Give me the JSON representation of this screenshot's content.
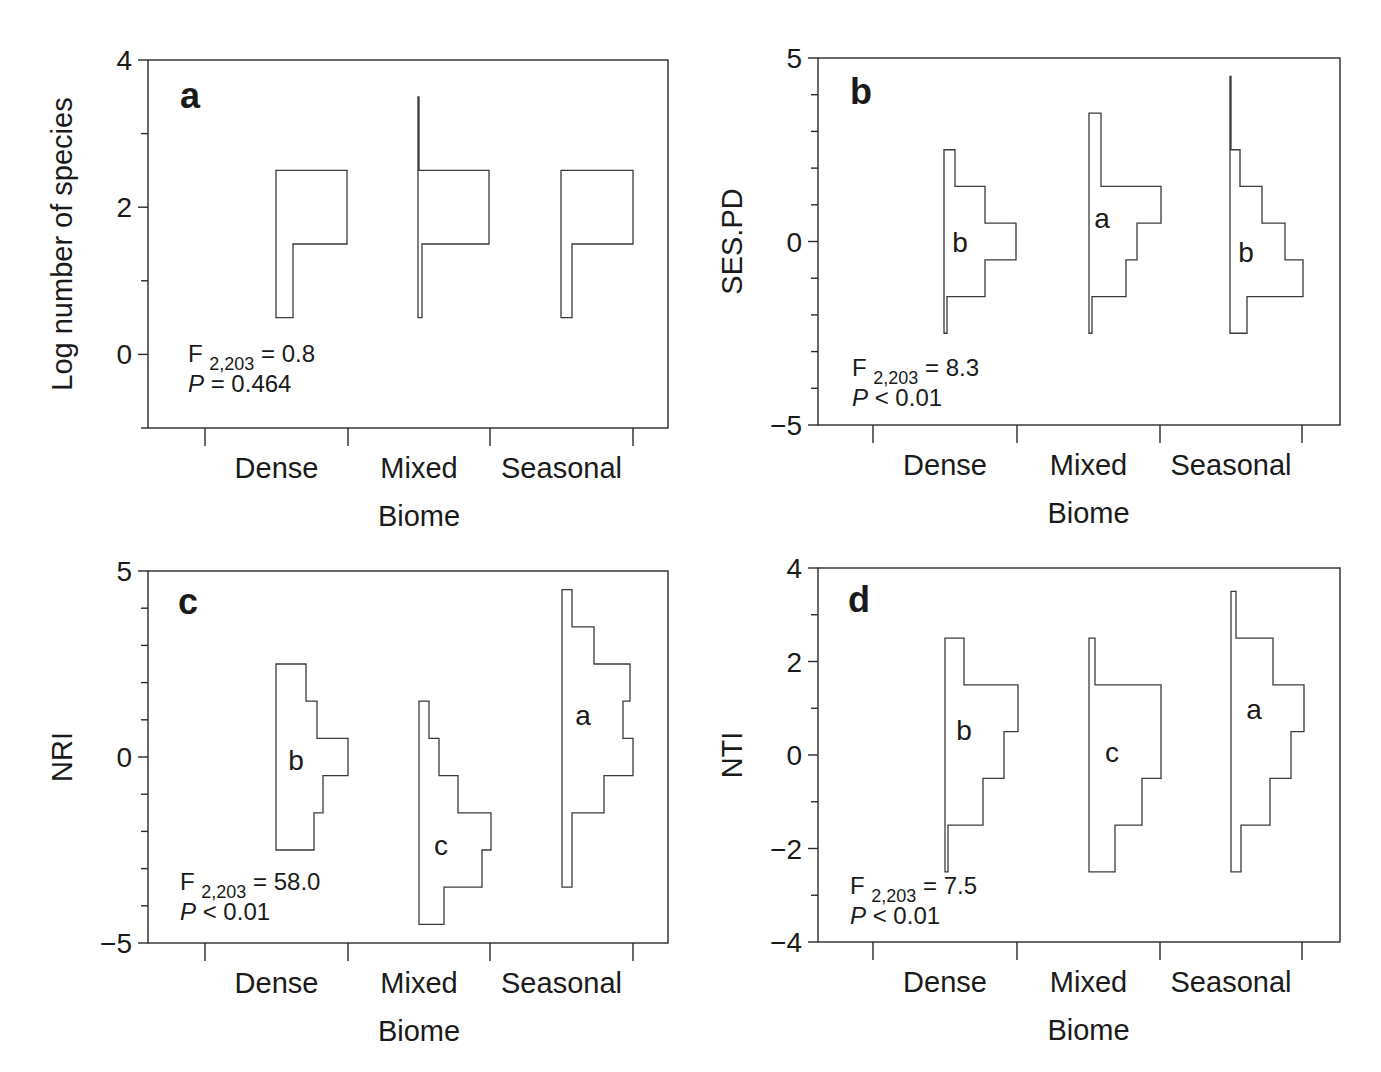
{
  "chart_data": [
    {
      "type": "histogram",
      "panel": "a",
      "ylabel": "Log number of species",
      "xlabel": "Biome",
      "categories": [
        "Dense",
        "Mixed",
        "Seasonal"
      ],
      "ylim": [
        -1,
        4
      ],
      "yticks": [
        0,
        2,
        4
      ],
      "stats": {
        "F_label": "F",
        "F_sub": "2,203",
        "F_value": "= 0.8",
        "P_label": "P",
        "P_value": "= 0.464"
      },
      "group_letters": [],
      "series": [
        {
          "name": "Dense",
          "bins": [
            {
              "lo": 0.5,
              "hi": 1.5,
              "width": 17
            },
            {
              "lo": 1.5,
              "hi": 2.5,
              "width": 71
            }
          ]
        },
        {
          "name": "Mixed",
          "bins": [
            {
              "lo": 0.5,
              "hi": 1.5,
              "width": 4
            },
            {
              "lo": 1.5,
              "hi": 2.5,
              "width": 71
            },
            {
              "lo": 2.5,
              "hi": 3.5,
              "width": 1
            }
          ]
        },
        {
          "name": "Seasonal",
          "bins": [
            {
              "lo": 0.5,
              "hi": 1.5,
              "width": 11
            },
            {
              "lo": 1.5,
              "hi": 2.5,
              "width": 72
            }
          ]
        }
      ]
    },
    {
      "type": "histogram",
      "panel": "b",
      "ylabel": "SES.PD",
      "xlabel": "Biome",
      "categories": [
        "Dense",
        "Mixed",
        "Seasonal"
      ],
      "ylim": [
        -5,
        5
      ],
      "yticks": [
        -5,
        0,
        5
      ],
      "stats": {
        "F_label": "F",
        "F_sub": "2,203",
        "F_value": "= 8.3",
        "P_label": "P",
        "P_value": "< 0.01"
      },
      "group_letters": [
        "b",
        "a",
        "b"
      ],
      "series": [
        {
          "name": "Dense",
          "bins": [
            {
              "lo": -2.5,
              "hi": -1.5,
              "width": 3
            },
            {
              "lo": -1.5,
              "hi": -0.5,
              "width": 41
            },
            {
              "lo": -0.5,
              "hi": 0.5,
              "width": 72
            },
            {
              "lo": 0.5,
              "hi": 1.5,
              "width": 41
            },
            {
              "lo": 1.5,
              "hi": 2.5,
              "width": 11
            }
          ]
        },
        {
          "name": "Mixed",
          "bins": [
            {
              "lo": -2.5,
              "hi": -1.5,
              "width": 3
            },
            {
              "lo": -1.5,
              "hi": -0.5,
              "width": 37
            },
            {
              "lo": -0.5,
              "hi": 0.5,
              "width": 48
            },
            {
              "lo": 0.5,
              "hi": 1.5,
              "width": 72
            },
            {
              "lo": 1.5,
              "hi": 2.5,
              "width": 12
            },
            {
              "lo": 2.5,
              "hi": 3.5,
              "width": 12
            }
          ]
        },
        {
          "name": "Seasonal",
          "bins": [
            {
              "lo": -2.5,
              "hi": -1.5,
              "width": 17
            },
            {
              "lo": -1.5,
              "hi": -0.5,
              "width": 73
            },
            {
              "lo": -0.5,
              "hi": 0.5,
              "width": 55
            },
            {
              "lo": 0.5,
              "hi": 1.5,
              "width": 32
            },
            {
              "lo": 1.5,
              "hi": 2.5,
              "width": 10
            },
            {
              "lo": 2.5,
              "hi": 4.5,
              "width": 1
            }
          ]
        }
      ]
    },
    {
      "type": "histogram",
      "panel": "c",
      "ylabel": "NRI",
      "xlabel": "Biome",
      "categories": [
        "Dense",
        "Mixed",
        "Seasonal"
      ],
      "ylim": [
        -5,
        5
      ],
      "yticks": [
        -5,
        0,
        5
      ],
      "stats": {
        "F_label": "F",
        "F_sub": "2,203",
        "F_value": "= 58.0",
        "P_label": "P",
        "P_value": "< 0.01"
      },
      "group_letters": [
        "b",
        "c",
        "a"
      ],
      "series": [
        {
          "name": "Dense",
          "bins": [
            {
              "lo": -2.5,
              "hi": -1.5,
              "width": 38
            },
            {
              "lo": -1.5,
              "hi": -0.5,
              "width": 47
            },
            {
              "lo": -0.5,
              "hi": 0.5,
              "width": 72
            },
            {
              "lo": 0.5,
              "hi": 1.5,
              "width": 41
            },
            {
              "lo": 1.5,
              "hi": 2.5,
              "width": 30
            }
          ]
        },
        {
          "name": "Mixed",
          "bins": [
            {
              "lo": -4.5,
              "hi": -3.5,
              "width": 25
            },
            {
              "lo": -3.5,
              "hi": -2.5,
              "width": 63
            },
            {
              "lo": -2.5,
              "hi": -1.5,
              "width": 72
            },
            {
              "lo": -1.5,
              "hi": -0.5,
              "width": 39
            },
            {
              "lo": -0.5,
              "hi": 0.5,
              "width": 20
            },
            {
              "lo": 0.5,
              "hi": 1.5,
              "width": 10
            }
          ]
        },
        {
          "name": "Seasonal",
          "bins": [
            {
              "lo": -3.5,
              "hi": -1.5,
              "width": 10
            },
            {
              "lo": -1.5,
              "hi": -0.5,
              "width": 42
            },
            {
              "lo": -0.5,
              "hi": 0.5,
              "width": 71
            },
            {
              "lo": 0.5,
              "hi": 1.5,
              "width": 61
            },
            {
              "lo": 1.5,
              "hi": 2.5,
              "width": 68
            },
            {
              "lo": 2.5,
              "hi": 3.5,
              "width": 32
            },
            {
              "lo": 3.5,
              "hi": 4.5,
              "width": 10
            }
          ]
        }
      ]
    },
    {
      "type": "histogram",
      "panel": "d",
      "ylabel": "NTI",
      "xlabel": "Biome",
      "categories": [
        "Dense",
        "Mixed",
        "Seasonal"
      ],
      "ylim": [
        -4,
        4
      ],
      "yticks": [
        -4,
        -2,
        0,
        2,
        4
      ],
      "stats": {
        "F_label": "F",
        "F_sub": "2,203",
        "F_value": "= 7.5",
        "P_label": "P",
        "P_value": "< 0.01"
      },
      "group_letters": [
        "b",
        "c",
        "a"
      ],
      "series": [
        {
          "name": "Dense",
          "bins": [
            {
              "lo": -2.5,
              "hi": -1.5,
              "width": 3
            },
            {
              "lo": -1.5,
              "hi": -0.5,
              "width": 38
            },
            {
              "lo": -0.5,
              "hi": 0.5,
              "width": 59
            },
            {
              "lo": 0.5,
              "hi": 1.5,
              "width": 73
            },
            {
              "lo": 1.5,
              "hi": 2.5,
              "width": 19
            }
          ]
        },
        {
          "name": "Mixed",
          "bins": [
            {
              "lo": -2.5,
              "hi": -1.5,
              "width": 26
            },
            {
              "lo": -1.5,
              "hi": -0.5,
              "width": 53
            },
            {
              "lo": -0.5,
              "hi": 1.5,
              "width": 72
            },
            {
              "lo": 1.5,
              "hi": 2.5,
              "width": 6
            }
          ]
        },
        {
          "name": "Seasonal",
          "bins": [
            {
              "lo": -2.5,
              "hi": -1.5,
              "width": 10
            },
            {
              "lo": -1.5,
              "hi": -0.5,
              "width": 39
            },
            {
              "lo": -0.5,
              "hi": 0.5,
              "width": 60
            },
            {
              "lo": 0.5,
              "hi": 1.5,
              "width": 73
            },
            {
              "lo": 1.5,
              "hi": 2.5,
              "width": 42
            },
            {
              "lo": 2.5,
              "hi": 3.5,
              "width": 5
            }
          ]
        }
      ]
    }
  ],
  "layout": [
    {
      "box": [
        148,
        60,
        668,
        428
      ],
      "yTop": 4,
      "yBot": -1,
      "ticksMinor": [
        3,
        1,
        -1
      ],
      "catTicks": [
        205,
        348,
        490,
        633
      ],
      "bases": [
        276,
        418,
        561
      ],
      "letterPos": [
        [
          0,
          0
        ],
        [
          0,
          0
        ],
        [
          0,
          0
        ]
      ],
      "ytitleX": 72,
      "letterX": 180,
      "letterY": 108,
      "statX": 188,
      "statY": 362
    },
    {
      "box": [
        818,
        58,
        1340,
        425
      ],
      "yTop": 5,
      "yBot": -5,
      "ticksMinor": [
        4,
        3,
        2,
        1,
        -1,
        -2,
        -3,
        -4
      ],
      "catTicks": [
        873,
        1017,
        1160,
        1302
      ],
      "bases": [
        944,
        1089,
        1230
      ],
      "letterPos": [
        [
          960,
          252
        ],
        [
          1102,
          228
        ],
        [
          1246,
          262
        ]
      ],
      "ytitleX": 742,
      "letterX": 850,
      "letterY": 104,
      "statX": 852,
      "statY": 376
    },
    {
      "box": [
        148,
        571,
        668,
        943
      ],
      "yTop": 5,
      "yBot": -5,
      "ticksMinor": [
        4,
        3,
        2,
        1,
        -1,
        -2,
        -3,
        -4
      ],
      "catTicks": [
        205,
        348,
        490,
        633
      ],
      "bases": [
        276,
        419,
        562
      ],
      "letterPos": [
        [
          296,
          770
        ],
        [
          441,
          855
        ],
        [
          583,
          725
        ]
      ],
      "ytitleX": 72,
      "letterX": 178,
      "letterY": 614,
      "statX": 180,
      "statY": 890
    },
    {
      "box": [
        818,
        568,
        1340,
        942
      ],
      "yTop": 4,
      "yBot": -4,
      "ticksMinor": [
        3,
        1,
        -1,
        -3
      ],
      "catTicks": [
        873,
        1017,
        1160,
        1302
      ],
      "bases": [
        945,
        1089,
        1231
      ],
      "letterPos": [
        [
          964,
          740
        ],
        [
          1112,
          762
        ],
        [
          1254,
          719
        ]
      ],
      "ytitleX": 742,
      "letterX": 848,
      "letterY": 612,
      "statX": 850,
      "statY": 894
    }
  ]
}
